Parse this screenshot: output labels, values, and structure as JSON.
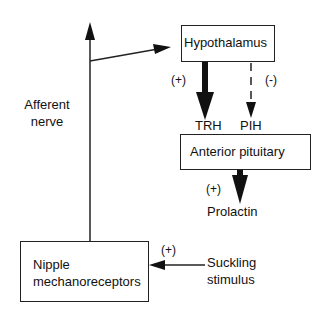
{
  "diagram": {
    "nodes": {
      "hypothalamus": "Hypothalamus",
      "anterior_pituitary": "Anterior pituitary",
      "nipple_line1": "Nipple",
      "nipple_line2": "mechanoreceptors"
    },
    "labels": {
      "afferent_line1": "Afferent",
      "afferent_line2": "nerve",
      "trh": "TRH",
      "pih": "PIH",
      "prolactin": "Prolactin",
      "suckling_line1": "Suckling",
      "suckling_line2": "stimulus"
    },
    "signs": {
      "trh_effect": "(+)",
      "pih_effect": "(-)",
      "prolactin_effect": "(+)",
      "suckling_effect": "(+)"
    },
    "edges": [
      {
        "from": "Suckling stimulus",
        "to": "Nipple mechanoreceptors",
        "effect": "(+)"
      },
      {
        "from": "Nipple mechanoreceptors",
        "to": "Hypothalamus",
        "via": "Afferent nerve"
      },
      {
        "from": "Hypothalamus",
        "to": "Anterior pituitary",
        "signal": "TRH",
        "effect": "(+)",
        "style": "thick"
      },
      {
        "from": "Hypothalamus",
        "to": "Anterior pituitary",
        "signal": "PIH",
        "effect": "(-)",
        "style": "dashed"
      },
      {
        "from": "Anterior pituitary",
        "to": "Prolactin",
        "effect": "(+)",
        "style": "thick"
      }
    ]
  }
}
